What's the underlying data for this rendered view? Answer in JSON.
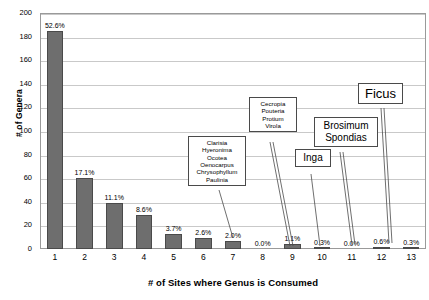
{
  "chart_data": {
    "type": "bar",
    "title": "",
    "xlabel": "# of Sites where Genus is Consumed",
    "ylabel": "# of Genera",
    "categories": [
      "1",
      "2",
      "3",
      "4",
      "5",
      "6",
      "7",
      "8",
      "9",
      "10",
      "11",
      "12",
      "13"
    ],
    "values": [
      185,
      60,
      39,
      29,
      13,
      9,
      7,
      0,
      4,
      1,
      0,
      2,
      1
    ],
    "data_labels": [
      "52.6%",
      "17.1%",
      "11.1%",
      "8.6%",
      "3.7%",
      "2.6%",
      "2.0%",
      "0.0%",
      "1.1%",
      "0.3%",
      "0.0%",
      "0.6%",
      "0.3%"
    ],
    "ylim": [
      0,
      200
    ],
    "ytick_values": [
      "0",
      "20",
      "40",
      "60",
      "80",
      "100",
      "120",
      "140",
      "160",
      "180",
      "200"
    ],
    "grid": true,
    "legend": "none",
    "bar_color": "#6e6e6e",
    "bar_border_color": "#4a4a4a",
    "grid_color": "#c9c9c9",
    "frame_color": "#9a9a9a",
    "annotations": [
      {
        "id": "callout-6-genera",
        "text": "Clarisia\nHyeronima\nOcotea\nOenocarpus\nChrysophyllum\nPaulinia",
        "points_to_category": "7"
      },
      {
        "id": "callout-4-genera",
        "text": "Cecropia\nPouteria\nProtium\nVirola",
        "points_to_category": "9"
      },
      {
        "id": "callout-inga",
        "text": "Inga",
        "points_to_category": "10"
      },
      {
        "id": "callout-brosimum-spondias",
        "text": "Brosimum\nSpondias",
        "points_to_category": "12"
      },
      {
        "id": "callout-ficus",
        "text": "Ficus",
        "points_to_category": "13"
      }
    ]
  }
}
